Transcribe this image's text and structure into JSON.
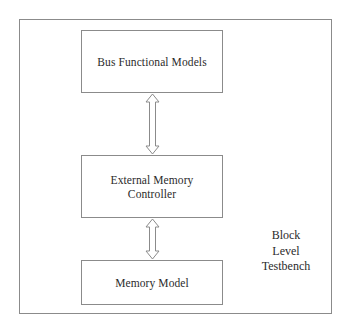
{
  "diagram": {
    "title": "Block Level Testbench",
    "frame": {
      "name": "block-level-testbench-boundary"
    },
    "caption": {
      "lines": [
        "Block",
        "Level",
        "Testbench"
      ],
      "text": "Block\nLevel\nTestbench"
    },
    "blocks": [
      {
        "id": "bus-functional-models",
        "label": "Bus Functional Models",
        "lines": [
          "Bus Functional Models"
        ]
      },
      {
        "id": "external-memory-controller",
        "label": "External Memory\nController",
        "lines": [
          "External Memory",
          "Controller"
        ]
      },
      {
        "id": "memory-model",
        "label": "Memory Model",
        "lines": [
          "Memory Model"
        ]
      }
    ],
    "connectors": [
      {
        "id": "bfm-to-emc",
        "type": "double-headed-arrow",
        "direction": "bidirectional",
        "from": "bus-functional-models",
        "to": "external-memory-controller"
      },
      {
        "id": "emc-to-memory",
        "type": "double-headed-arrow",
        "direction": "bidirectional",
        "from": "external-memory-controller",
        "to": "memory-model"
      }
    ],
    "colors": {
      "line": "#8b8b8b",
      "text": "#2b2b2b",
      "background": "#ffffff",
      "arrow_fill": "#ffffff"
    }
  }
}
